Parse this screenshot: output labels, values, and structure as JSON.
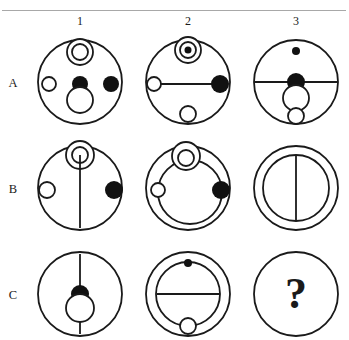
{
  "puzzle": {
    "type": "matrix-reasoning",
    "title": "",
    "column_labels": [
      "1",
      "2",
      "3"
    ],
    "row_labels": [
      "A",
      "B",
      "C"
    ],
    "missing_cell": "C3",
    "missing_marker": "?",
    "colors": {
      "ink": "#1a1a1a",
      "rule": "#a8a8a8",
      "background": "#ffffff",
      "fill_black": "#111111",
      "fill_white": "#ffffff"
    },
    "cells": [
      {
        "id": "A1",
        "outer_circle": {
          "cx": 54,
          "cy": 52,
          "r": 42
        },
        "elements": [
          {
            "shape": "ring",
            "cx": 54,
            "cy": 22,
            "r": 13
          },
          {
            "shape": "ring",
            "cx": 54,
            "cy": 22,
            "r": 8
          },
          {
            "shape": "ring",
            "cx": 23,
            "cy": 54,
            "r": 7
          },
          {
            "shape": "dot",
            "cx": 54,
            "cy": 54,
            "r": 8
          },
          {
            "shape": "dot",
            "cx": 85,
            "cy": 54,
            "r": 8
          },
          {
            "shape": "ring",
            "cx": 54,
            "cy": 70,
            "r": 13
          }
        ]
      },
      {
        "id": "A2",
        "outer_circle": {
          "cx": 54,
          "cy": 52,
          "r": 42
        },
        "elements": [
          {
            "shape": "ring",
            "cx": 54,
            "cy": 20,
            "r": 13
          },
          {
            "shape": "ring",
            "cx": 54,
            "cy": 20,
            "r": 8
          },
          {
            "shape": "dot",
            "cx": 54,
            "cy": 20,
            "r": 3.5
          },
          {
            "shape": "line",
            "x1": 21,
            "y1": 54,
            "x2": 86,
            "y2": 54
          },
          {
            "shape": "ring",
            "cx": 20,
            "cy": 54,
            "r": 7
          },
          {
            "shape": "dot",
            "cx": 86,
            "cy": 54,
            "r": 9
          },
          {
            "shape": "ring",
            "cx": 54,
            "cy": 84,
            "r": 8
          }
        ]
      },
      {
        "id": "A3",
        "outer_circle": {
          "cx": 54,
          "cy": 52,
          "r": 42
        },
        "elements": [
          {
            "shape": "dot",
            "cx": 54,
            "cy": 21,
            "r": 4
          },
          {
            "shape": "line",
            "x1": 12,
            "y1": 52,
            "x2": 96,
            "y2": 52
          },
          {
            "shape": "dot",
            "cx": 54,
            "cy": 52,
            "r": 9
          },
          {
            "shape": "ring",
            "cx": 54,
            "cy": 68,
            "r": 13
          },
          {
            "shape": "ring",
            "cx": 54,
            "cy": 86,
            "r": 8
          }
        ]
      },
      {
        "id": "B1",
        "outer_circle": {
          "cx": 54,
          "cy": 52,
          "r": 42
        },
        "elements": [
          {
            "shape": "ring",
            "cx": 54,
            "cy": 19,
            "r": 14
          },
          {
            "shape": "ring",
            "cx": 54,
            "cy": 19,
            "r": 8
          },
          {
            "shape": "line",
            "x1": 54,
            "y1": 19,
            "x2": 54,
            "y2": 92
          },
          {
            "shape": "ring",
            "cx": 21,
            "cy": 54,
            "r": 8
          },
          {
            "shape": "dot",
            "cx": 88,
            "cy": 54,
            "r": 9
          }
        ]
      },
      {
        "id": "B2",
        "outer_circle": {
          "cx": 54,
          "cy": 52,
          "r": 42
        },
        "elements": [
          {
            "shape": "ring",
            "cx": 56,
            "cy": 56,
            "r": 32
          },
          {
            "shape": "ring",
            "cx": 52,
            "cy": 20,
            "r": 14
          },
          {
            "shape": "ring",
            "cx": 52,
            "cy": 22,
            "r": 8
          },
          {
            "shape": "ring",
            "cx": 24,
            "cy": 54,
            "r": 7
          },
          {
            "shape": "dot",
            "cx": 87,
            "cy": 54,
            "r": 9
          }
        ]
      },
      {
        "id": "B3",
        "outer_circle": {
          "cx": 54,
          "cy": 52,
          "r": 42
        },
        "elements": [
          {
            "shape": "ring",
            "cx": 54,
            "cy": 52,
            "r": 33
          },
          {
            "shape": "line",
            "x1": 54,
            "y1": 19,
            "x2": 54,
            "y2": 85
          }
        ]
      },
      {
        "id": "C1",
        "outer_circle": {
          "cx": 54,
          "cy": 52,
          "r": 42
        },
        "elements": [
          {
            "shape": "line",
            "x1": 54,
            "y1": 12,
            "x2": 54,
            "y2": 92
          },
          {
            "shape": "dot",
            "cx": 54,
            "cy": 52,
            "r": 9
          },
          {
            "shape": "ring",
            "cx": 54,
            "cy": 66,
            "r": 14
          }
        ]
      },
      {
        "id": "C2",
        "outer_circle": {
          "cx": 54,
          "cy": 52,
          "r": 42
        },
        "elements": [
          {
            "shape": "ring",
            "cx": 54,
            "cy": 52,
            "r": 32
          },
          {
            "shape": "dot",
            "cx": 54,
            "cy": 21,
            "r": 4
          },
          {
            "shape": "line",
            "x1": 23,
            "y1": 52,
            "x2": 86,
            "y2": 52
          },
          {
            "shape": "ring",
            "cx": 54,
            "cy": 84,
            "r": 8
          }
        ]
      },
      {
        "id": "C3",
        "outer_circle": {
          "cx": 54,
          "cy": 52,
          "r": 42
        },
        "elements": [],
        "question_mark": "?"
      }
    ]
  }
}
